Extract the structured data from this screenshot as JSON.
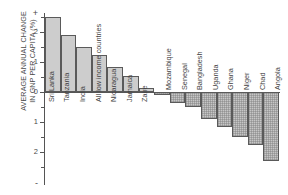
{
  "chart_data": {
    "type": "bar",
    "title": "",
    "xlabel": "",
    "ylabel": "AVERAGE ANNUAL CHANGE\nIN GNP PER CAPITA (%)",
    "ylim": [
      -2.6,
      2.8
    ],
    "yticks": [
      2,
      1,
      0,
      -1,
      -2
    ],
    "ytick_labels": [
      "2",
      "1",
      "0",
      "1",
      "2"
    ],
    "axis_top_sign": "+",
    "axis_bottom_sign": "-",
    "grid": false,
    "legend": "none",
    "categories": [
      "Sri Lanka",
      "Tanzania",
      "India",
      "All low income countries",
      "Nicaragua",
      "Jamaica",
      "Zaire",
      "Mozambique",
      "Senegal",
      "Bangladesh",
      "Uganda",
      "Ghana",
      "Niger",
      "Chad",
      "Angola"
    ],
    "values": [
      2.5,
      1.9,
      1.5,
      1.25,
      0.85,
      0.55,
      0.15,
      -0.1,
      -0.35,
      -0.5,
      -0.9,
      -1.15,
      -1.5,
      -1.75,
      -2.3
    ],
    "colors": {
      "positive_fill": "#cdcdcd",
      "negative_fill": "#c6c6c6",
      "bar_outline": "#5a5a5a",
      "axis": "#555555",
      "text": "#3f3f3f"
    }
  }
}
